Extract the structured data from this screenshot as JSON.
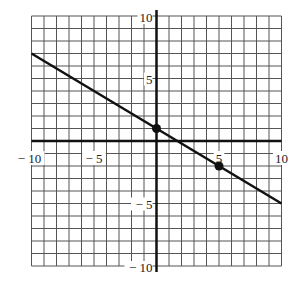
{
  "chart_data": {
    "type": "line",
    "title": "",
    "xlabel": "",
    "ylabel": "",
    "xlim": [
      -10,
      10
    ],
    "ylim": [
      -10,
      10
    ],
    "grid": true,
    "grid_step": 1,
    "x_ticks": [
      -10,
      -5,
      5,
      10
    ],
    "y_ticks": [
      10,
      5,
      -5,
      -10
    ],
    "x_tick_labels": [
      "− 10",
      "− 5",
      "5",
      "10"
    ],
    "y_tick_labels": [
      "10",
      "5",
      "− 5",
      "− 10"
    ],
    "series": [
      {
        "name": "line",
        "equation": "y = -3/5 x + 1",
        "x": [
          -10,
          10
        ],
        "y": [
          7,
          -5
        ]
      }
    ],
    "points": [
      {
        "x": 0,
        "y": 1
      },
      {
        "x": 5,
        "y": -2
      }
    ]
  }
}
